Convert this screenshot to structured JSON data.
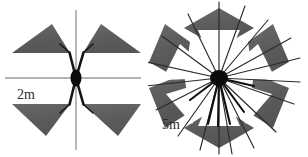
{
  "figure": {
    "background_color": "#ffffff",
    "width": 308,
    "height": 157
  },
  "colors": {
    "blade_fill": "#5d5d5d",
    "blade_fill_light": "#6b6b6b",
    "hub": "#0b0b0b",
    "spoke": "#151515",
    "axis_line": "#9a9a9a",
    "thin_spoke": "#3a3a3a",
    "label_text": "#2b2b2b"
  },
  "panels": [
    {
      "id": "left",
      "name": "two-meter-rotor",
      "scale_label": "2m",
      "blade_count": 4,
      "spoke_count": 4,
      "has_crosshair_axes": true,
      "center": {
        "x": 76,
        "y": 78
      },
      "hub_radius": {
        "rx": 5.5,
        "ry": 8
      },
      "blades": [
        {
          "position": "upper-left",
          "apex": "top",
          "angle_deg": 135
        },
        {
          "position": "upper-right",
          "apex": "top",
          "angle_deg": 45
        },
        {
          "position": "lower-left",
          "apex": "bottom",
          "angle_deg": 225
        },
        {
          "position": "lower-right",
          "apex": "bottom",
          "angle_deg": 315
        }
      ],
      "axes": [
        {
          "orientation": "horizontal",
          "from_x": 5,
          "to_x": 140,
          "y": 78
        },
        {
          "orientation": "vertical",
          "from_y": 10,
          "to_y": 150,
          "x": 76
        }
      ]
    },
    {
      "id": "right",
      "name": "five-meter-rotor",
      "scale_label": "5m",
      "blade_count": 6,
      "spoke_count": 18,
      "has_crosshair_axes": false,
      "center": {
        "x": 71,
        "y": 78
      },
      "hub_radius": {
        "rx": 9,
        "ry": 8
      },
      "ring_outer_radius": 70,
      "ring_inner_radius": 28,
      "blades": [
        {
          "index": 0,
          "angle_deg": 90
        },
        {
          "index": 1,
          "angle_deg": 30
        },
        {
          "index": 2,
          "angle_deg": 330
        },
        {
          "index": 3,
          "angle_deg": 270
        },
        {
          "index": 4,
          "angle_deg": 210
        },
        {
          "index": 5,
          "angle_deg": 150
        }
      ]
    }
  ],
  "labels": {
    "left_scale": "2m",
    "right_scale": "5m"
  },
  "icons": {
    "hub": "hub-dot-icon",
    "blade": "triangular-blade-icon",
    "axis": "crosshair-axis-icon",
    "spoke": "radial-spoke-icon"
  }
}
